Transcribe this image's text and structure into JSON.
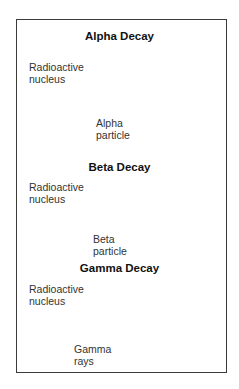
{
  "sections": [
    {
      "title": "Alpha Decay",
      "source_label_line1": "Radioactive",
      "source_label_line2": "nucleus",
      "emission_label_line1": "Alpha",
      "emission_label_line2": "particle",
      "particle_charge": "+"
    },
    {
      "title": "Beta Decay",
      "source_label_line1": "Radioactive",
      "source_label_line2": "nucleus",
      "emission_label_line1": "Beta",
      "emission_label_line2": "particle",
      "particle_charge": "−"
    },
    {
      "title": "Gamma Decay",
      "source_label_line1": "Radioactive",
      "source_label_line2": "nucleus",
      "emission_label_line1": "Gamma",
      "emission_label_line2": "rays",
      "particle_charge": ""
    }
  ],
  "colors": {
    "nucleus_dark": "#4a4a4a",
    "nucleus_light": "#b8b8b8",
    "arrow": "#c8c8c8",
    "frame": "#3a3a3a"
  }
}
